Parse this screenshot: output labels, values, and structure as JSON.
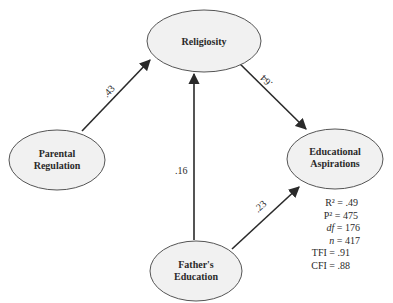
{
  "diagram": {
    "nodes": [
      {
        "id": "religiosity",
        "lines": [
          "Religiosity"
        ]
      },
      {
        "id": "parental_regulation",
        "lines": [
          "Parental",
          "Regulation"
        ]
      },
      {
        "id": "educational_aspirations",
        "lines": [
          "Educational",
          "Aspirations"
        ]
      },
      {
        "id": "fathers_education",
        "lines": [
          "Father's",
          "Education"
        ]
      }
    ],
    "paths": [
      {
        "from": "parental_regulation",
        "to": "religiosity",
        "coefficient": ".43"
      },
      {
        "from": "religiosity",
        "to": "educational_aspirations",
        "coefficient": ".64"
      },
      {
        "from": "fathers_education",
        "to": "religiosity",
        "coefficient": ".16"
      },
      {
        "from": "fathers_education",
        "to": "educational_aspirations",
        "coefficient": ".23"
      }
    ],
    "stats": [
      {
        "label": "R²",
        "italic": false,
        "value": ".49"
      },
      {
        "label": "P²",
        "italic": false,
        "value": "475"
      },
      {
        "label": "df",
        "italic": true,
        "value": "176"
      },
      {
        "label": "n",
        "italic": true,
        "value": "417"
      },
      {
        "label": "TFI",
        "italic": false,
        "value": ".91"
      },
      {
        "label": "CFI",
        "italic": false,
        "value": ".88"
      }
    ],
    "colors": {
      "line": "#2a2a2a",
      "ellipse_fill": "#f1f1f1",
      "ellipse_stroke": "#555555"
    }
  }
}
